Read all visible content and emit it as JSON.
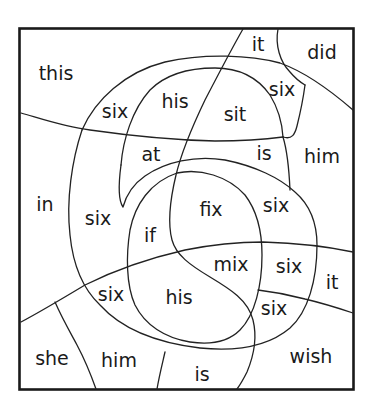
{
  "puzzle": {
    "type": "color-by-sight-word",
    "colors": {
      "border": "#1a1a1a",
      "lines": "#222222",
      "text": "#1a1a1a",
      "background": "#ffffff"
    },
    "words": [
      {
        "id": "w1",
        "text": "this",
        "x": 56,
        "y": 73
      },
      {
        "id": "w2",
        "text": "it",
        "x": 258,
        "y": 44
      },
      {
        "id": "w3",
        "text": "did",
        "x": 322,
        "y": 52
      },
      {
        "id": "w4",
        "text": "six",
        "x": 115,
        "y": 111
      },
      {
        "id": "w5",
        "text": "his",
        "x": 175,
        "y": 101
      },
      {
        "id": "w6",
        "text": "sit",
        "x": 235,
        "y": 114
      },
      {
        "id": "w7",
        "text": "six",
        "x": 282,
        "y": 89
      },
      {
        "id": "w8",
        "text": "at",
        "x": 151,
        "y": 154
      },
      {
        "id": "w9",
        "text": "is",
        "x": 264,
        "y": 153
      },
      {
        "id": "w10",
        "text": "him",
        "x": 322,
        "y": 156
      },
      {
        "id": "w11",
        "text": "in",
        "x": 45,
        "y": 204
      },
      {
        "id": "w12",
        "text": "six",
        "x": 98,
        "y": 218
      },
      {
        "id": "w13",
        "text": "fix",
        "x": 211,
        "y": 209
      },
      {
        "id": "w14",
        "text": "six",
        "x": 276,
        "y": 205
      },
      {
        "id": "w15",
        "text": "if",
        "x": 150,
        "y": 235
      },
      {
        "id": "w16",
        "text": "mix",
        "x": 231,
        "y": 264
      },
      {
        "id": "w17",
        "text": "six",
        "x": 289,
        "y": 266
      },
      {
        "id": "w18",
        "text": "it",
        "x": 332,
        "y": 282
      },
      {
        "id": "w19",
        "text": "six",
        "x": 111,
        "y": 294
      },
      {
        "id": "w20",
        "text": "his",
        "x": 179,
        "y": 297
      },
      {
        "id": "w21",
        "text": "six",
        "x": 274,
        "y": 308
      },
      {
        "id": "w22",
        "text": "she",
        "x": 52,
        "y": 358
      },
      {
        "id": "w23",
        "text": "him",
        "x": 119,
        "y": 360
      },
      {
        "id": "w24",
        "text": "is",
        "x": 202,
        "y": 374
      },
      {
        "id": "w25",
        "text": "wish",
        "x": 311,
        "y": 356
      }
    ]
  }
}
